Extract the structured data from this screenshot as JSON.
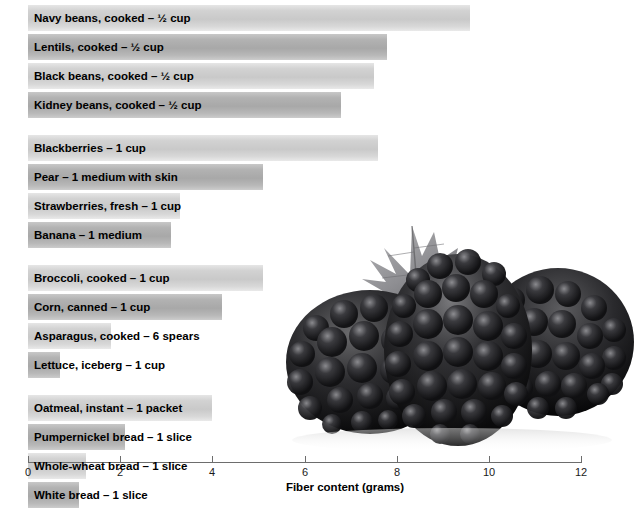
{
  "chart_data": {
    "type": "bar",
    "orientation": "horizontal",
    "title": "",
    "xlabel": "Fiber content (grams)",
    "ylabel": "",
    "xlim": [
      0,
      12
    ],
    "xticks": [
      0,
      2,
      4,
      6,
      8,
      10,
      12
    ],
    "xtick_labels": [
      "0",
      "2",
      "4",
      "6",
      "8",
      "10",
      "12"
    ],
    "grid": false,
    "legend": false,
    "groups": [
      {
        "label": "Legumes",
        "items": [
          {
            "label": "Navy beans, cooked – ½ cup",
            "value": 9.6,
            "shade": "light"
          },
          {
            "label": "Lentils, cooked – ½ cup",
            "value": 7.8,
            "shade": "dark"
          },
          {
            "label": "Black beans, cooked – ½ cup",
            "value": 7.5,
            "shade": "light"
          },
          {
            "label": "Kidney beans, cooked – ½ cup",
            "value": 6.8,
            "shade": "dark"
          }
        ]
      },
      {
        "label": "Fruits",
        "items": [
          {
            "label": "Blackberries – 1 cup",
            "value": 7.6,
            "shade": "light"
          },
          {
            "label": "Pear – 1 medium with skin",
            "value": 5.1,
            "shade": "dark"
          },
          {
            "label": "Strawberries, fresh – 1 cup",
            "value": 3.3,
            "shade": "light"
          },
          {
            "label": "Banana – 1 medium",
            "value": 3.1,
            "shade": "dark"
          }
        ]
      },
      {
        "label": "Vegetables",
        "items": [
          {
            "label": "Broccoli, cooked – 1 cup",
            "value": 5.1,
            "shade": "light"
          },
          {
            "label": "Corn, canned – 1 cup",
            "value": 4.2,
            "shade": "dark"
          },
          {
            "label": "Asparagus, cooked – 6 spears",
            "value": 1.8,
            "shade": "light"
          },
          {
            "label": "Lettuce, iceberg – 1 cup",
            "value": 0.7,
            "shade": "dark"
          }
        ]
      },
      {
        "label": "Breads",
        "items": [
          {
            "label": "Oatmeal, instant – 1 packet",
            "value": 4.0,
            "shade": "light"
          },
          {
            "label": "Pumpernickel bread – 1 slice",
            "value": 2.1,
            "shade": "dark"
          },
          {
            "label": "Whole-wheat bread – 1 slice",
            "value": 1.25,
            "shade": "light"
          },
          {
            "label": "White bread – 1 slice",
            "value": 1.1,
            "shade": "dark"
          }
        ]
      }
    ]
  },
  "photo": {
    "name": "blackberries-photo",
    "description": "Three blackberries with a leaf, grayscale"
  },
  "colors": {
    "bar_light": "#cccccc",
    "bar_dark": "#ababab",
    "axis": "#6d6d6d",
    "group_label": "#58585a",
    "text": "#000000",
    "background": "#ffffff"
  }
}
